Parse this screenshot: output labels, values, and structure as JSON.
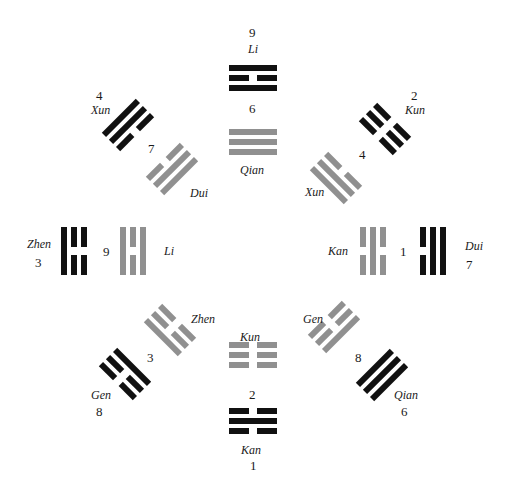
{
  "colors": {
    "inner": "#909090",
    "outer": "#111111",
    "background": "#ffffff"
  },
  "labels": {
    "n_num": "9",
    "n_name": "Li",
    "n_inner_num": "6",
    "n_inner_name": "Qian",
    "nw_num": "4",
    "nw_name": "Xun",
    "nw_inner_num": "7",
    "nw_inner_name": "Dui",
    "ne_num": "2",
    "ne_name": "Kun",
    "ne_inner_num": "4",
    "ne_inner_name": "Xun",
    "w_name": "Zhen",
    "w_num": "3",
    "w_inner_num": "9",
    "w_inner_name": "Li",
    "e_inner_name": "Kan",
    "e_inner_num": "1",
    "e_name": "Dui",
    "e_num": "7",
    "sw_inner_name": "Zhen",
    "sw_inner_num": "3",
    "sw_name": "Gen",
    "sw_num": "8",
    "se_inner_name": "Gen",
    "se_inner_num": "8",
    "se_name": "Qian",
    "se_num": "6",
    "s_inner_name": "Kun",
    "s_inner_num": "2",
    "s_name": "Kan",
    "s_num": "1"
  },
  "trigrams": [
    {
      "id": "outer-n",
      "name": "Li",
      "ring": "outer",
      "cx": 253,
      "cy": 78,
      "angle": 0,
      "lines": [
        1,
        0,
        1
      ]
    },
    {
      "id": "inner-n",
      "name": "Qian",
      "ring": "inner",
      "cx": 253,
      "cy": 142,
      "angle": 0,
      "lines": [
        1,
        1,
        1
      ]
    },
    {
      "id": "outer-s",
      "name": "Kan",
      "ring": "outer",
      "cx": 253,
      "cy": 421,
      "angle": 0,
      "lines": [
        0,
        1,
        0
      ]
    },
    {
      "id": "inner-s",
      "name": "Kun",
      "ring": "inner",
      "cx": 253,
      "cy": 355,
      "angle": 0,
      "lines": [
        0,
        0,
        0
      ]
    },
    {
      "id": "outer-w",
      "name": "Zhen",
      "ring": "outer",
      "cx": 74,
      "cy": 251,
      "angle": 90,
      "lines": [
        0,
        0,
        1
      ]
    },
    {
      "id": "inner-w",
      "name": "Li",
      "ring": "inner",
      "cx": 133,
      "cy": 251,
      "angle": 90,
      "lines": [
        1,
        0,
        1
      ]
    },
    {
      "id": "outer-e",
      "name": "Dui",
      "ring": "outer",
      "cx": 433,
      "cy": 251,
      "angle": 90,
      "lines": [
        1,
        1,
        0
      ]
    },
    {
      "id": "inner-e",
      "name": "Kan",
      "ring": "inner",
      "cx": 373,
      "cy": 251,
      "angle": 90,
      "lines": [
        0,
        1,
        0
      ]
    },
    {
      "id": "outer-nw",
      "name": "Xun",
      "ring": "outer",
      "cx": 128,
      "cy": 125,
      "angle": -45,
      "lines": [
        1,
        1,
        0
      ]
    },
    {
      "id": "inner-nw",
      "name": "Dui",
      "ring": "inner",
      "cx": 172,
      "cy": 169,
      "angle": -45,
      "lines": [
        0,
        1,
        1
      ]
    },
    {
      "id": "outer-ne",
      "name": "Kun",
      "ring": "outer",
      "cx": 385,
      "cy": 129,
      "angle": 45,
      "lines": [
        0,
        0,
        0
      ]
    },
    {
      "id": "inner-ne",
      "name": "Xun",
      "ring": "inner",
      "cx": 336,
      "cy": 178,
      "angle": 45,
      "lines": [
        0,
        1,
        1
      ]
    },
    {
      "id": "outer-sw",
      "name": "Gen",
      "ring": "outer",
      "cx": 125,
      "cy": 374,
      "angle": 45,
      "lines": [
        1,
        0,
        0
      ]
    },
    {
      "id": "inner-sw",
      "name": "Zhen",
      "ring": "inner",
      "cx": 170,
      "cy": 330,
      "angle": 45,
      "lines": [
        0,
        0,
        1
      ]
    },
    {
      "id": "outer-se",
      "name": "Qian",
      "ring": "outer",
      "cx": 382,
      "cy": 375,
      "angle": -45,
      "lines": [
        1,
        1,
        1
      ]
    },
    {
      "id": "inner-se",
      "name": "Gen",
      "ring": "inner",
      "cx": 334,
      "cy": 327,
      "angle": -45,
      "lines": [
        0,
        0,
        1
      ]
    }
  ]
}
